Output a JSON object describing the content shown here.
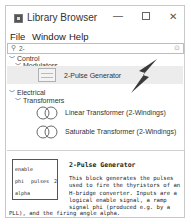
{
  "window": {
    "title": "Library Browser",
    "controls": {
      "minimize": "—",
      "maximize": "☐",
      "close": "✕"
    }
  },
  "menu": {
    "items": [
      "File",
      "Window",
      "Help"
    ]
  },
  "search": {
    "value": "2-",
    "icon": "search-icon",
    "clear_icon": "clear-icon"
  },
  "tree": {
    "control": {
      "label": "Control",
      "expanded": true,
      "modulators": {
        "label": "Modulators",
        "expanded": true,
        "items": [
          {
            "label": "2-Pulse Generator",
            "icon": "pulse-generator-block-icon",
            "selected": true
          }
        ]
      }
    },
    "electrical": {
      "label": "Electrical",
      "expanded": true,
      "transformers": {
        "label": "Transformers",
        "expanded": true,
        "items": [
          {
            "label": "Linear Transformer (2-Windings)",
            "icon": "transformer-icon"
          },
          {
            "label": "Saturable Transformer (2-Windings)",
            "icon": "transformer-icon"
          }
        ]
      }
    }
  },
  "description": {
    "title": "2-Pulse Generator",
    "block_ports": {
      "in": [
        "enable",
        "phi",
        "alpha"
      ],
      "out": [
        "pulses"
      ],
      "out_suffix": "2"
    },
    "text": "This block generates the pulses used to fire the thyristors of an H-bridge converter. Inputs are a logical enable signal, a ramp signal phi (produced e.g. by a",
    "text_tail": "PLL), and the firing angle alpha."
  }
}
